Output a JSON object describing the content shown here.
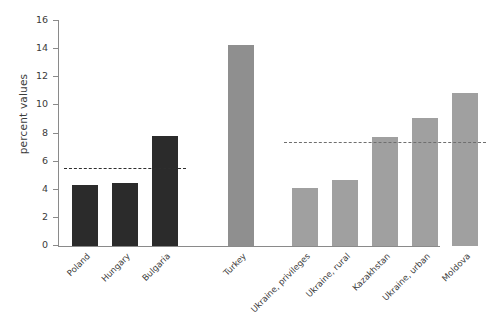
{
  "chart_data": {
    "type": "bar",
    "title": "",
    "subtitle": "",
    "xlabel": "",
    "ylabel": "percent values",
    "ylim": [
      0,
      16
    ],
    "yticks": [
      0,
      2,
      4,
      6,
      8,
      10,
      12,
      14,
      16
    ],
    "ytick_labels": [
      "0",
      "2",
      "4",
      "6",
      "8",
      "10",
      "12",
      "14",
      "16"
    ],
    "grid": false,
    "legend": "none",
    "categories": [
      "Poland",
      "Hungary",
      "Bulgaria",
      "Turkey",
      "Ukraine, privileges",
      "Ukraine, rural",
      "Kazakhstan",
      "Ukraine, urban",
      "Moldova"
    ],
    "values": [
      4.35,
      4.45,
      7.85,
      14.3,
      4.1,
      4.7,
      7.75,
      9.1,
      10.9
    ],
    "bar_colors": [
      "#2b2b2b",
      "#2b2b2b",
      "#2b2b2b",
      "#8f8f8f",
      "#a0a0a0",
      "#a0a0a0",
      "#a0a0a0",
      "#a0a0a0",
      "#a0a0a0"
    ],
    "groups": [
      {
        "name": "eu-group",
        "categories": [
          "Poland",
          "Hungary",
          "Bulgaria"
        ]
      },
      {
        "name": "turkey-group",
        "categories": [
          "Turkey"
        ]
      },
      {
        "name": "cis-group",
        "categories": [
          "Ukraine, privileges",
          "Ukraine, rural",
          "Kazakhstan",
          "Ukraine, urban",
          "Moldova"
        ]
      }
    ],
    "reference_lines": [
      {
        "name": "eu-average",
        "value": 5.5,
        "style": "dashed",
        "color": "#2e2e2e",
        "spans": "Poland-Bulgaria"
      },
      {
        "name": "cis-average",
        "value": 7.3,
        "style": "dashed",
        "color": "#6f6f6f",
        "spans": "Ukraine-privileges-Moldova"
      }
    ]
  },
  "axis": {
    "y_label": "percent values"
  },
  "colors": {
    "dark_bar": "#2b2b2b",
    "mid_bar": "#8f8f8f",
    "light_bar": "#a0a0a0",
    "axis": "#8a8a8a",
    "text": "#3b3b3b",
    "background": "#ffffff"
  }
}
